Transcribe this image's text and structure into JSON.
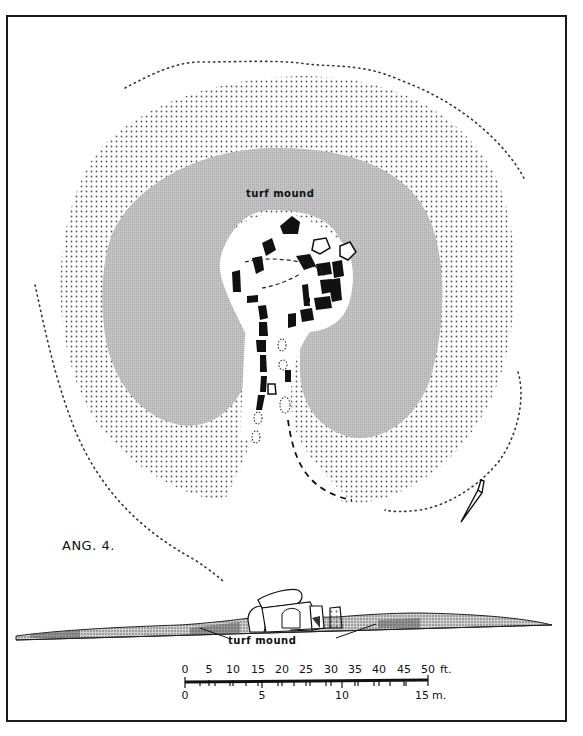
{
  "figure": {
    "label": "ANG. 4.",
    "plan_label": "turf mound",
    "section_label": "turf mound",
    "north_arrow": "north-arrow-icon"
  },
  "scale": {
    "feet_ticks": [
      "0",
      "5",
      "10",
      "15",
      "20",
      "25",
      "30",
      "35",
      "40",
      "45",
      "50"
    ],
    "feet_unit": "ft.",
    "metre_ticks": [
      "0",
      "5",
      "10",
      "15"
    ],
    "metre_unit": "m."
  },
  "colors": {
    "ink": "#111111",
    "inner_mound_grey": "#bdbdbd",
    "stipple": "#555555",
    "paper": "#ffffff"
  }
}
